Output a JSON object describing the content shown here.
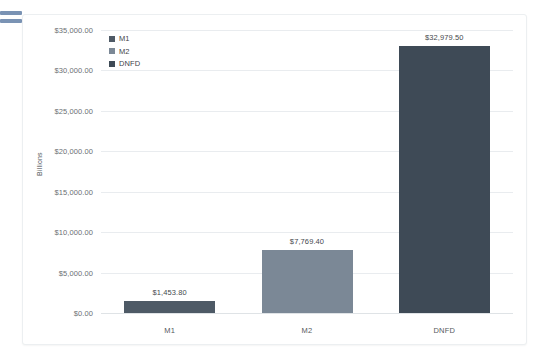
{
  "menu_icon": {
    "name": "hamburger-menu-icon",
    "color": "#7a93b4"
  },
  "chart_data": {
    "type": "bar",
    "title": "",
    "subtitle": "",
    "xlabel": "",
    "ylabel": "Billions",
    "categories": [
      "M1",
      "M2",
      "DNFD"
    ],
    "values": [
      1453.8,
      7769.4,
      32979.5
    ],
    "data_labels": [
      "$1,453.80",
      "$7,769.40",
      "$32,979.50"
    ],
    "series": [
      {
        "name": "M1",
        "values": [
          1453.8,
          null,
          null
        ],
        "color": "#4e5a66"
      },
      {
        "name": "M2",
        "values": [
          null,
          7769.4,
          null
        ],
        "color": "#7b8896"
      },
      {
        "name": "DNFD",
        "values": [
          null,
          null,
          32979.5
        ],
        "color": "#3e4a56"
      }
    ],
    "ylim": [
      0,
      35000
    ],
    "ytick_step": 5000,
    "ytick_labels": [
      "$35,000.00",
      "$30,000.00",
      "$25,000.00",
      "$20,000.00",
      "$15,000.00",
      "$10,000.00",
      "$5,000.00",
      "$0.00"
    ],
    "ytick_values": [
      35000,
      30000,
      25000,
      20000,
      15000,
      10000,
      5000,
      0
    ],
    "grid": true,
    "grid_orientation": "horizontal",
    "legend_position": "top-left",
    "legend": [
      {
        "label": "M1",
        "color": "#4e5a66"
      },
      {
        "label": "M2",
        "color": "#7b8896"
      },
      {
        "label": "DNFD",
        "color": "#3e4a56"
      }
    ],
    "colors": {
      "grid": "#e9ecef",
      "axis": "#dfe3e6",
      "tick_text": "#6b6f73",
      "label_text": "#46494d",
      "card_background": "#ffffff",
      "card_border": "#eceff1"
    }
  }
}
